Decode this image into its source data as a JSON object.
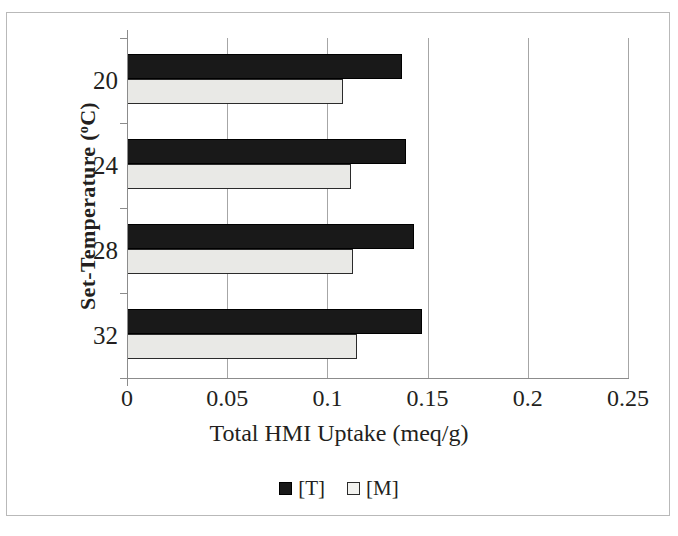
{
  "chart_data": {
    "type": "bar",
    "orientation": "horizontal",
    "title": "",
    "xlabel": "Total HMI Uptake (meq/g)",
    "ylabel": "Set-Temperature (°C)",
    "categories": [
      "20",
      "24",
      "28",
      "32"
    ],
    "series": [
      {
        "name": "[T]",
        "color": "#191919",
        "values": [
          0.137,
          0.139,
          0.143,
          0.147
        ]
      },
      {
        "name": "[M]",
        "color": "#e9e9e6",
        "values": [
          0.108,
          0.112,
          0.113,
          0.115
        ]
      }
    ],
    "xlim": [
      0,
      0.25
    ],
    "xticks": [
      "0",
      "0.05",
      "0.1",
      "0.15",
      "0.2",
      "0.25"
    ],
    "xtick_values": [
      0,
      0.05,
      0.1,
      0.15,
      0.2,
      0.25
    ],
    "grid": "vertical",
    "legend_position": "bottom"
  },
  "axes": {
    "y_title_main": "Set-Temperature (",
    "y_title_sup": "o",
    "y_title_end": "C)",
    "x_title": "Total HMI Uptake (meq/g)"
  },
  "legend": {
    "entries": [
      {
        "label": "[T]",
        "swatch": "filled-black-square"
      },
      {
        "label": "[M]",
        "swatch": "open-white-square"
      }
    ]
  },
  "colors": {
    "series_t": "#191919",
    "series_m": "#e9e9e6",
    "gridline": "#a6a6a6",
    "axis": "#8c8c8c",
    "frame": "#b9b9b9",
    "text": "#231f20"
  }
}
